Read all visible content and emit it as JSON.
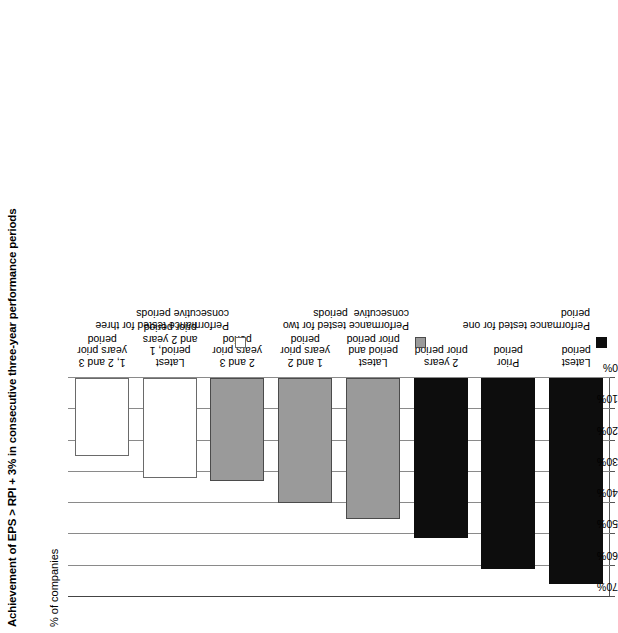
{
  "chart_data": {
    "type": "bar",
    "orientation": "horizontal-rotated",
    "title": "Achievement of EPS > RPI + 3% in consecutive three-year performance periods",
    "ylabel": "% of companies",
    "xlabel": "",
    "ylim": [
      0,
      70
    ],
    "grid": true,
    "tick_labels": [
      "70%",
      "60%",
      "50%",
      "40%",
      "30%",
      "20%",
      "10%",
      "0%"
    ],
    "tick_values": [
      70,
      60,
      50,
      40,
      30,
      20,
      10,
      0
    ],
    "categories": [
      "Latest\nperiod",
      "Prior\nperiod",
      "2 years\nprior period",
      "Latest\nperiod and\nprior period",
      "1 and 2\nyears prior\nperiod",
      "2 and 3\nyears prior\nperiod",
      "Latest\nperiod, 1\nand 2 years\nprior period",
      "1, 2 and 3\nyears prior\nperiod"
    ],
    "values": [
      66,
      61,
      51,
      45,
      40,
      33,
      32,
      25
    ],
    "series_of_bar": [
      "one",
      "one",
      "one",
      "two",
      "two",
      "two",
      "three",
      "three"
    ],
    "legend_position": "right",
    "legend": [
      {
        "key": "one",
        "label": "Performance tested for one\nperiod",
        "color": "#0d0d0d"
      },
      {
        "key": "two",
        "label": "Performance tested for two\nconsecutive  periods",
        "color": "#9a9a9a"
      },
      {
        "key": "three",
        "label": "Performance tested for three\nconsecutive periods",
        "color": "#ffffff"
      }
    ]
  }
}
